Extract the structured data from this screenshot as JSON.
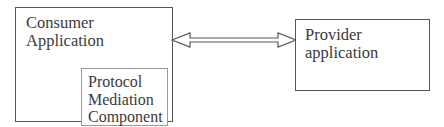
{
  "diagram": {
    "type": "component-diagram",
    "nodes": [
      {
        "id": "consumer",
        "label": "Consumer\nApplication",
        "children": [
          {
            "id": "protocol-mediation",
            "label": "Protocol\nMediation\nComponent"
          }
        ]
      },
      {
        "id": "provider",
        "label": "Provider\napplication"
      }
    ],
    "edges": [
      {
        "from": "consumer",
        "to": "provider",
        "style": "hollow double-headed block arrow",
        "direction": "bidirectional"
      }
    ]
  },
  "consumer": {
    "label": "Consumer\nApplication"
  },
  "protocol": {
    "label": "Protocol\nMediation\nComponent"
  },
  "provider": {
    "label": "Provider\napplication"
  },
  "colors": {
    "box_border": "#555555",
    "inner_box_border": "#9a9a9a",
    "text": "#3a3a3a",
    "arrow_stroke": "#555555",
    "background": "#ffffff"
  }
}
